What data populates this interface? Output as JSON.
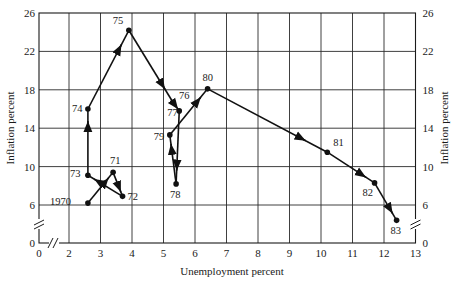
{
  "chart_data": {
    "type": "line",
    "title": "",
    "xlabel": "Unemployment percent",
    "ylabel": "Inflation percent",
    "ylabel_right": "Inflation percent",
    "xlim": [
      0,
      13
    ],
    "ylim": [
      0,
      26
    ],
    "x_ticks": [
      0,
      2,
      3,
      4,
      5,
      6,
      7,
      8,
      9,
      10,
      11,
      12,
      13
    ],
    "y_ticks": [
      0,
      6,
      10,
      14,
      18,
      22,
      26
    ],
    "y_ticks_right": [
      0,
      6,
      10,
      14,
      18,
      22,
      26
    ],
    "axis_breaks": {
      "x": "between 0 and 2",
      "y": "between 0 and 6"
    },
    "grid": true,
    "legend": null,
    "series": [
      {
        "name": "Unemployment vs. Inflation, 1970-1983",
        "points": [
          {
            "label": "1970",
            "x": 2.6,
            "y": 6.2
          },
          {
            "label": "71",
            "x": 3.4,
            "y": 9.4
          },
          {
            "label": "72",
            "x": 3.7,
            "y": 6.9
          },
          {
            "label": "73",
            "x": 2.6,
            "y": 9.1
          },
          {
            "label": "74",
            "x": 2.6,
            "y": 16.0
          },
          {
            "label": "75",
            "x": 3.9,
            "y": 24.2
          },
          {
            "label": "76",
            "x": 5.3,
            "y": 16.7
          },
          {
            "label": "77",
            "x": 5.5,
            "y": 15.8
          },
          {
            "label": "78",
            "x": 5.4,
            "y": 8.2
          },
          {
            "label": "79",
            "x": 5.2,
            "y": 13.3
          },
          {
            "label": "80",
            "x": 6.4,
            "y": 18.1
          },
          {
            "label": "81",
            "x": 10.2,
            "y": 11.5
          },
          {
            "label": "82",
            "x": 11.7,
            "y": 8.3
          },
          {
            "label": "83",
            "x": 12.4,
            "y": 4.4
          }
        ]
      }
    ]
  }
}
